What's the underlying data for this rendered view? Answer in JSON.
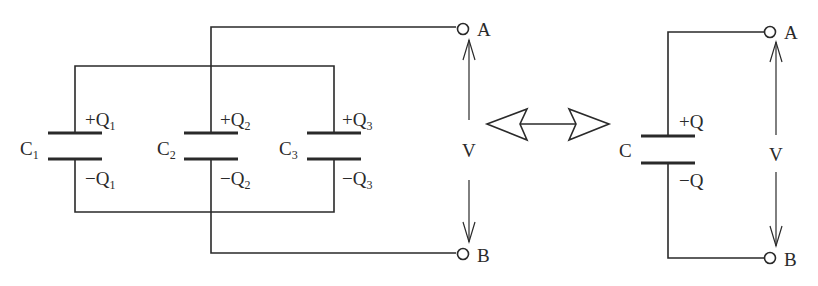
{
  "left_circuit": {
    "capacitors": [
      {
        "name": "C",
        "sub": "1",
        "plus_label": "+Q",
        "plus_sub": "1",
        "minus_label": "−Q",
        "minus_sub": "1"
      },
      {
        "name": "C",
        "sub": "2",
        "plus_label": "+Q",
        "plus_sub": "2",
        "minus_label": "−Q",
        "minus_sub": "2"
      },
      {
        "name": "C",
        "sub": "3",
        "plus_label": "+Q",
        "plus_sub": "3",
        "minus_label": "−Q",
        "minus_sub": "3"
      }
    ],
    "terminal_top": "A",
    "terminal_bottom": "B",
    "voltage_label": "V"
  },
  "equivalence_symbol": "double-arrow",
  "right_circuit": {
    "capacitor": {
      "name": "C",
      "plus_label": "+Q",
      "minus_label": "−Q"
    },
    "terminal_top": "A",
    "terminal_bottom": "B",
    "voltage_label": "V"
  },
  "colors": {
    "line": "#2a2a2a",
    "background": "#ffffff"
  }
}
